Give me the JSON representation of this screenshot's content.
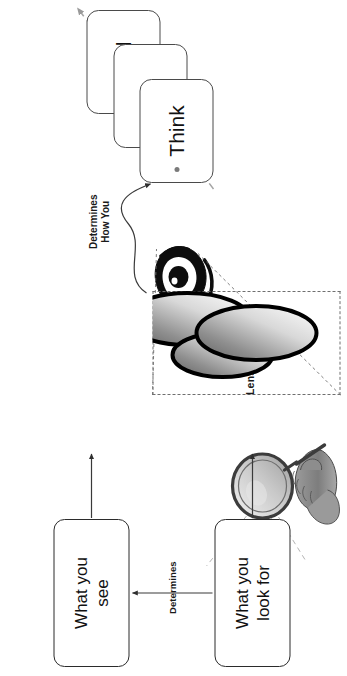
{
  "diagram": {
    "orientation": "rotated-90-ccw",
    "background_color": "#ffffff"
  },
  "flow_boxes": [
    {
      "id": "look-for",
      "label": "What you\nlook for",
      "border_color": "#2b2b2b"
    },
    {
      "id": "see",
      "label": "What you\nsee",
      "border_color": "#2b2b2b"
    }
  ],
  "connector_labels": {
    "determines": "Determines",
    "determines_how_you": "Determines\nHow You"
  },
  "lenses": {
    "label": "Lenses of Life",
    "box_border_color": "#6f6f6f",
    "ellipses": [
      {
        "id": "lens-top-left",
        "gradient_from": "#6d6d6d",
        "gradient_to": "#ffffff",
        "stroke": "#000000"
      },
      {
        "id": "lens-bottom",
        "gradient_from": "#6d6d6d",
        "gradient_to": "#ffffff",
        "stroke": "#000000"
      },
      {
        "id": "lens-right",
        "gradient_from": "#6d6d6d",
        "gradient_to": "#ffffff",
        "stroke": "#000000"
      }
    ]
  },
  "cards": [
    {
      "id": "think",
      "label": "Think",
      "has_bullet": true,
      "border_color": "#4a4a4a"
    },
    {
      "id": "act",
      "label": "Act",
      "has_bullet": false,
      "border_color": "#4a4a4a"
    },
    {
      "id": "feel",
      "label": "Feel",
      "has_bullet": false,
      "border_color": "#4a4a4a"
    }
  ],
  "illustrations": [
    {
      "id": "magnifier-hand",
      "name": "hand-holding-magnifier-illustration"
    },
    {
      "id": "eye",
      "name": "stylized-eye-illustration"
    }
  ],
  "arrows": [
    {
      "id": "look-for-to-hand",
      "style": "solid",
      "color": "#3a3a3a"
    },
    {
      "id": "see-to-eye",
      "style": "solid",
      "color": "#3a3a3a"
    },
    {
      "id": "look-for-to-see",
      "style": "solid",
      "color": "#3a3a3a"
    },
    {
      "id": "lenses-to-think",
      "style": "curved",
      "color": "#3a3a3a"
    },
    {
      "id": "think-act-feel-progression",
      "style": "dashed",
      "color": "#9a9a9a"
    },
    {
      "id": "eye-callout-top",
      "style": "dashed",
      "color": "#6f6f6f"
    },
    {
      "id": "eye-callout-bottom",
      "style": "dashed",
      "color": "#6f6f6f"
    }
  ]
}
